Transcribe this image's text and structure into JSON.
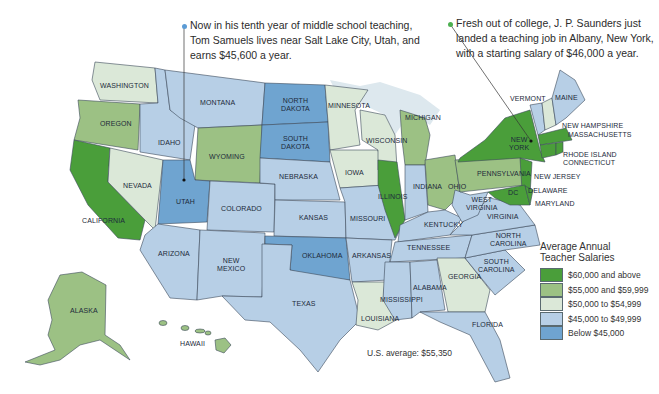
{
  "callouts": {
    "utah": {
      "lines": [
        "Now in his tenth year of middle school teaching,",
        "Tom Samuels lives near Salt Lake City, Utah, and",
        "earns $45,600 a year."
      ],
      "dot_color": "#5b9bd5"
    },
    "new_york": {
      "lines": [
        "Fresh out of college, J. P. Saunders just",
        "landed a teaching job in Albany, New York,",
        "with a starting salary of $46,000 a year."
      ],
      "dot_color": "#4caf50"
    }
  },
  "legend": {
    "title_line1": "Average Annual",
    "title_line2": "Teacher Salaries",
    "items": [
      {
        "label": "$60,000 and above",
        "color": "#4a9e3a"
      },
      {
        "label": "$55,000 and $59,999",
        "color": "#9cc184"
      },
      {
        "label": "$50,000 to $54,999",
        "color": "#dbe8d8"
      },
      {
        "label": "$45,000 to $49,999",
        "color": "#b7cfe6"
      },
      {
        "label": "Below $45,000",
        "color": "#6fa4d0"
      }
    ]
  },
  "us_average": "U.S. average: $55,350",
  "states": {
    "washington": "WASHINGTON",
    "oregon": "OREGON",
    "california": "CALIFORNIA",
    "nevada": "NEVADA",
    "idaho": "IDAHO",
    "montana": "MONTANA",
    "wyoming": "WYOMING",
    "utah": "UTAH",
    "colorado": "COLORADO",
    "arizona": "ARIZONA",
    "new_mexico_1": "NEW",
    "new_mexico_2": "MEXICO",
    "north_dakota_1": "NORTH",
    "north_dakota_2": "DAKOTA",
    "south_dakota_1": "SOUTH",
    "south_dakota_2": "DAKOTA",
    "nebraska": "NEBRASKA",
    "kansas": "KANSAS",
    "oklahoma": "OKLAHOMA",
    "texas": "TEXAS",
    "minnesota": "MINNESOTA",
    "iowa": "IOWA",
    "missouri": "MISSOURI",
    "arkansas": "ARKANSAS",
    "louisiana": "LOUISIANA",
    "wisconsin": "WISCONSIN",
    "illinois": "ILLINOIS",
    "michigan": "MICHIGAN",
    "indiana": "INDIANA",
    "ohio": "OHIO",
    "kentucky": "KENTUCKY",
    "tennessee": "TENNESSEE",
    "mississippi": "MISSISSIPPI",
    "alabama": "ALABAMA",
    "georgia": "GEORGIA",
    "florida": "FLORIDA",
    "south_carolina_1": "SOUTH",
    "south_carolina_2": "CAROLINA",
    "north_carolina_1": "NORTH",
    "north_carolina_2": "CAROLINA",
    "virginia": "VIRGINIA",
    "west_virginia_1": "WEST",
    "west_virginia_2": "VIRGINIA",
    "pennsylvania": "PENNSYLVANIA",
    "new_york_1": "NEW",
    "new_york_2": "YORK",
    "vermont": "VERMONT",
    "maine": "MAINE",
    "new_hampshire": "NEW HAMPSHIRE",
    "massachusetts": "MASSACHUSETTS",
    "rhode_island": "RHODE ISLAND",
    "connecticut": "CONNECTICUT",
    "new_jersey": "NEW JERSEY",
    "delaware": "DELAWARE",
    "maryland": "MARYLAND",
    "dc": "DC",
    "alaska": "ALASKA",
    "hawaii": "HAWAII"
  }
}
